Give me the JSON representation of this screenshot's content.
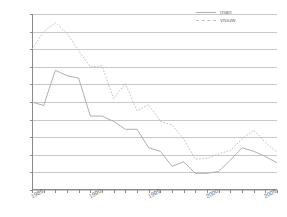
{
  "chart_data": {
    "type": "line",
    "title": "",
    "xlabel": "",
    "ylabel": "",
    "xlim": [
      1985,
      2006
    ],
    "ylim": [
      0,
      2
    ],
    "grid": true,
    "legend_position": "top-right",
    "y_ticks": [
      "0",
      "0,2",
      "0,4",
      "0,6",
      "0,8",
      "1",
      "1,2",
      "1,4",
      "1,6",
      "1,8",
      "2"
    ],
    "y_tick_values": [
      0,
      0.2,
      0.4,
      0.6,
      0.8,
      1,
      1.2,
      1.4,
      1.6,
      1.8,
      2
    ],
    "x_tick_labels": [
      "1985",
      "1990",
      "1995",
      "2000",
      "2005"
    ],
    "x_tick_values": [
      1985,
      1990,
      1995,
      2000,
      2005
    ],
    "x": [
      1985,
      1986,
      1987,
      1988,
      1989,
      1990,
      1991,
      1992,
      1993,
      1994,
      1995,
      1996,
      1997,
      1998,
      1999,
      2000,
      2001,
      2002,
      2003,
      2004,
      2005,
      2006
    ],
    "series": [
      {
        "name": "man",
        "style": "solid",
        "color": "#b0b0b0",
        "values": [
          1.0,
          0.96,
          1.36,
          1.3,
          1.27,
          0.84,
          0.84,
          0.78,
          0.69,
          0.69,
          0.48,
          0.44,
          0.27,
          0.32,
          0.19,
          0.19,
          0.21,
          0.34,
          0.48,
          0.44,
          0.38,
          0.31
        ]
      },
      {
        "name": "vrouw",
        "style": "dotted",
        "color": "#c0c0c0",
        "values": [
          1.6,
          1.8,
          1.9,
          1.78,
          1.58,
          1.4,
          1.41,
          1.04,
          1.21,
          0.9,
          0.97,
          0.78,
          0.74,
          0.58,
          0.35,
          0.36,
          0.41,
          0.45,
          0.58,
          0.68,
          0.54,
          0.43
        ]
      }
    ]
  },
  "legend": {
    "items": [
      {
        "label": "man",
        "style": "solid"
      },
      {
        "label": "vrouw",
        "style": "dotted"
      }
    ]
  }
}
